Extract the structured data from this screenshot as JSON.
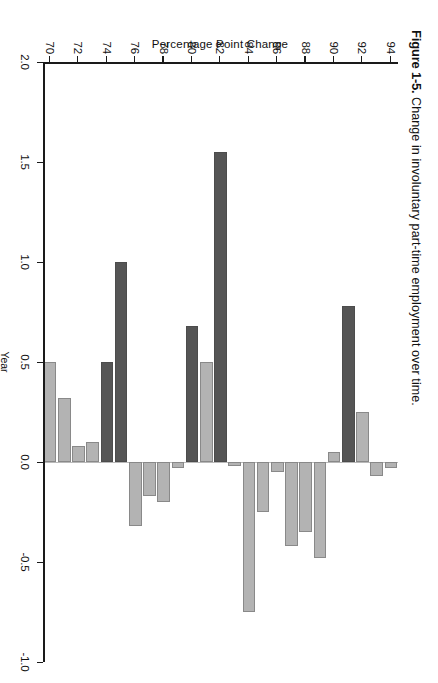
{
  "figure": {
    "number": "Figure 1-5.",
    "caption": "Change in involuntary part-time employment over time."
  },
  "colors": {
    "light_bar": "#b3b3b3",
    "dark_bar": "#555555",
    "axis": "#1a1a1a",
    "zero_line": "#bbbbbb",
    "background": "#ffffff"
  },
  "legend_note": "Dark bars mark recession years; light bars mark non-recession years.",
  "chart_data": {
    "type": "bar",
    "orientation": "vertical",
    "title": "Change in involuntary part-time employment over time.",
    "xlabel": "Year",
    "ylabel": "Percentage Point Change",
    "ylim": [
      -1.0,
      2.0
    ],
    "yticks": [
      "2.0",
      "1.5",
      "1.0",
      "0.5",
      "0.0",
      "-0.5",
      "-1.0"
    ],
    "ytick_values": [
      2.0,
      1.5,
      1.0,
      0.5,
      0.0,
      -0.5,
      -1.0
    ],
    "xticks": [
      "70",
      "72",
      "74",
      "76",
      "78",
      "80",
      "82",
      "84",
      "86",
      "88",
      "90",
      "92",
      "94"
    ],
    "xtick_values": [
      70,
      72,
      74,
      76,
      78,
      80,
      82,
      84,
      86,
      88,
      90,
      92,
      94
    ],
    "grid": false,
    "legend": "none",
    "categories": [
      70,
      71,
      72,
      73,
      74,
      75,
      76,
      77,
      78,
      79,
      80,
      81,
      82,
      83,
      84,
      85,
      86,
      87,
      88,
      89,
      90,
      91,
      92,
      93,
      94
    ],
    "values": [
      0.5,
      0.32,
      0.08,
      0.1,
      0.5,
      1.0,
      -0.32,
      -0.17,
      -0.2,
      -0.03,
      0.68,
      0.5,
      1.55,
      -0.02,
      -0.75,
      -0.25,
      -0.05,
      -0.42,
      -0.35,
      -0.48,
      0.05,
      0.78,
      0.25,
      -0.07,
      -0.03
    ],
    "bar_shades": [
      "light",
      "light",
      "light",
      "light",
      "dark",
      "dark",
      "light",
      "light",
      "light",
      "light",
      "dark",
      "light",
      "dark",
      "light",
      "light",
      "light",
      "light",
      "light",
      "light",
      "light",
      "light",
      "dark",
      "light",
      "light",
      "light"
    ]
  }
}
